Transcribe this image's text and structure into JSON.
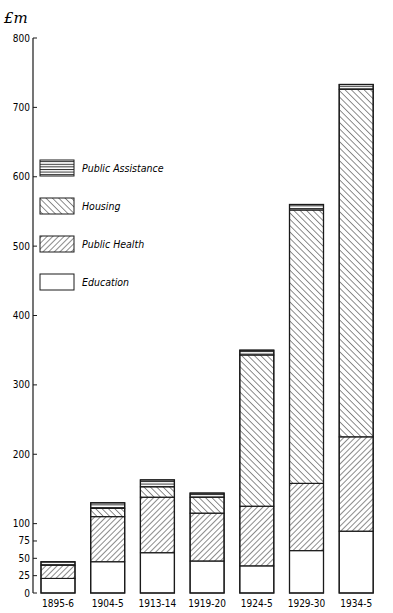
{
  "chart_data": {
    "type": "bar",
    "stacked": true,
    "title": "",
    "xlabel": "",
    "ylabel": "£m",
    "ylim": [
      0,
      800
    ],
    "yticks": [
      0,
      25,
      50,
      75,
      100,
      200,
      300,
      400,
      500,
      600,
      700,
      800
    ],
    "categories": [
      "1895-6",
      "1904-5",
      "1913-14",
      "1919-20",
      "1924-5",
      "1929-30",
      "1934-5"
    ],
    "series": [
      {
        "name": "Education",
        "pattern": "blank",
        "values": [
          21,
          45,
          58,
          46,
          39,
          61,
          89
        ]
      },
      {
        "name": "Public Health",
        "pattern": "hatch-forward",
        "values": [
          19,
          65,
          80,
          69,
          86,
          97,
          136
        ]
      },
      {
        "name": "Housing",
        "pattern": "hatch-backward",
        "values": [
          0,
          12,
          15,
          23,
          218,
          394,
          501
        ]
      },
      {
        "name": "Public Assistance",
        "pattern": "horizontal-lines",
        "values": [
          5,
          8,
          10,
          6,
          7,
          8,
          7
        ]
      }
    ],
    "totals": [
      45,
      130,
      163,
      144,
      350,
      560,
      733
    ],
    "legend": {
      "position": "upper-left",
      "entries": [
        "Public Assistance",
        "Housing",
        "Public Health",
        "Education"
      ]
    },
    "grid": false
  },
  "labels": {
    "ylabel": "£m"
  },
  "colors": {
    "ink": "#1a1a1a",
    "background": "#ffffff"
  }
}
